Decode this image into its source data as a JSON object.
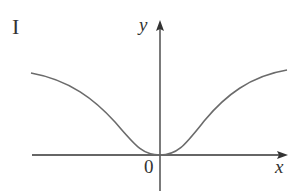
{
  "figure": {
    "panel_label": "I",
    "y_axis_label": "y",
    "x_axis_label": "x",
    "origin_label": "0",
    "curve_description": "even function, minimum 0 at origin, rising toward horizontal asymptote on both sides",
    "curve_color": "#6b6b6b",
    "axis_color": "#333333"
  }
}
